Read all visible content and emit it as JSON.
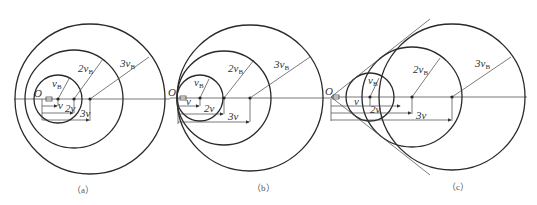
{
  "header_fragment": "...",
  "panels": [
    {
      "id": "a",
      "caption": "（a）",
      "origin_label": "O",
      "radius_labels": [
        "v",
        "B",
        "2v",
        "B",
        "3v",
        "B"
      ],
      "distance_labels": [
        "v",
        "2v",
        "3v"
      ]
    },
    {
      "id": "b",
      "caption": "（b）",
      "origin_label": "O",
      "radius_labels": [
        "v",
        "B",
        "2v",
        "B",
        "3v",
        "B"
      ],
      "distance_labels": [
        "v",
        "2v",
        "3v"
      ]
    },
    {
      "id": "c",
      "caption": "（c）",
      "origin_label": "O",
      "radius_labels": [
        "v",
        "B",
        "2v",
        "B",
        "3v",
        "B"
      ],
      "distance_labels": [
        "v",
        "2v",
        "3v"
      ]
    }
  ]
}
